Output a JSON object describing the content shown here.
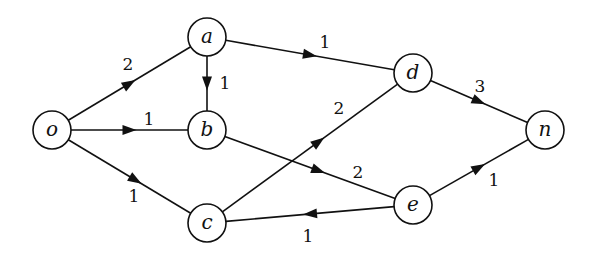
{
  "diagram": {
    "type": "directed-weighted-graph",
    "nodes": [
      {
        "id": "o",
        "label": "o",
        "x": 52,
        "y": 130
      },
      {
        "id": "a",
        "label": "a",
        "x": 207,
        "y": 37
      },
      {
        "id": "b",
        "label": "b",
        "x": 207,
        "y": 130
      },
      {
        "id": "c",
        "label": "c",
        "x": 207,
        "y": 223
      },
      {
        "id": "d",
        "label": "d",
        "x": 413,
        "y": 73
      },
      {
        "id": "e",
        "label": "e",
        "x": 413,
        "y": 205
      },
      {
        "id": "n",
        "label": "n",
        "x": 545,
        "y": 130
      }
    ],
    "edges": [
      {
        "from": "o",
        "to": "a",
        "weight": "2",
        "arrow_t": 0.5,
        "label_x": 128,
        "label_y": 64
      },
      {
        "from": "o",
        "to": "b",
        "weight": "1",
        "arrow_t": 0.5,
        "label_x": 149,
        "label_y": 119
      },
      {
        "from": "o",
        "to": "c",
        "weight": "1",
        "arrow_t": 0.55,
        "label_x": 134,
        "label_y": 196
      },
      {
        "from": "a",
        "to": "b",
        "weight": "1",
        "arrow_t": 0.5,
        "label_x": 225,
        "label_y": 83
      },
      {
        "from": "a",
        "to": "d",
        "weight": "1",
        "arrow_t": 0.5,
        "label_x": 325,
        "label_y": 42
      },
      {
        "from": "b",
        "to": "e",
        "weight": "2",
        "arrow_t": 0.55,
        "label_x": 358,
        "label_y": 172
      },
      {
        "from": "c",
        "to": "d",
        "weight": "2",
        "arrow_t": 0.55,
        "label_x": 339,
        "label_y": 108
      },
      {
        "from": "e",
        "to": "c",
        "weight": "1",
        "arrow_t": 0.5,
        "label_x": 308,
        "label_y": 236
      },
      {
        "from": "d",
        "to": "n",
        "weight": "3",
        "arrow_t": 0.5,
        "label_x": 480,
        "label_y": 86
      },
      {
        "from": "e",
        "to": "n",
        "weight": "1",
        "arrow_t": 0.5,
        "label_x": 494,
        "label_y": 180
      }
    ],
    "node_radius": 19,
    "stroke_color": "#111111",
    "background": "#ffffff"
  }
}
